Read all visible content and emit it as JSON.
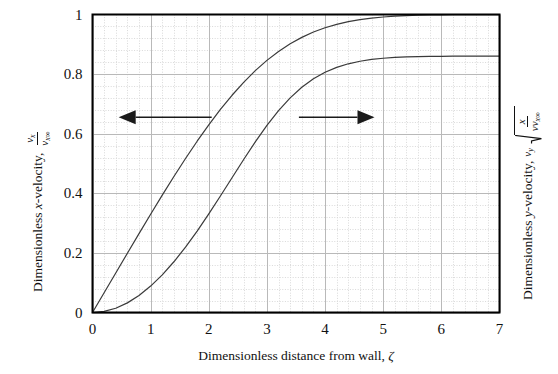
{
  "figure": {
    "background_color": "#ffffff",
    "frame_color": "#000000",
    "curve_color": "#3a3a3a",
    "major_grid_color": "#b9b9b9",
    "minor_grid_color": "#d9d9d9",
    "arrow_color": "#1a1a1a"
  },
  "axes": {
    "left": {
      "title_prefix": "Dimensionless",
      "title_var": "x",
      "title_suffix": "-velocity,",
      "symbol_numerator": "v",
      "symbol_numerator_sub": "x",
      "symbol_denominator": "v",
      "symbol_denominator_sub": "x∞",
      "ticks": [
        "0",
        "0.2",
        "0.4",
        "0.6",
        "0.8",
        "1"
      ],
      "tick_values": [
        0,
        0.2,
        0.4,
        0.6,
        0.8,
        1
      ],
      "range": [
        0,
        1
      ],
      "minor_per_major": 5
    },
    "right": {
      "title_prefix": "Dimensionless",
      "title_var": "y",
      "title_suffix": "-velocity,",
      "symbol_main": "v",
      "symbol_main_sub": "y",
      "radical_numerator": "x",
      "radical_denominator": "νv",
      "radical_denominator_sub": "x∞"
    },
    "bottom": {
      "title": "Dimensionless distance from wall,",
      "title_symbol": "ζ",
      "ticks": [
        "0",
        "1",
        "2",
        "3",
        "4",
        "5",
        "6",
        "7"
      ],
      "tick_values": [
        0,
        1,
        2,
        3,
        4,
        5,
        6,
        7
      ],
      "range": [
        0,
        7
      ],
      "minor_per_major": 5
    }
  },
  "annotations": [
    {
      "name": "left-pointing-arrow",
      "direction": "left",
      "at_y": 0.655,
      "x_start": 2.05,
      "x_end": 0.45
    },
    {
      "name": "right-pointing-arrow",
      "direction": "right",
      "at_y": 0.655,
      "x_start": 3.55,
      "x_end": 4.85
    }
  ],
  "chart_data": {
    "type": "line",
    "title": "",
    "xlabel": "Dimensionless distance from wall, ζ",
    "ylabel_left": "Dimensionless x-velocity, v_x / v_x∞",
    "ylabel_right": "Dimensionless y-velocity, v_y √(x / (ν v_x∞))",
    "xlim": [
      0,
      7
    ],
    "ylim": [
      0,
      1
    ],
    "grid": true,
    "grid_minor": true,
    "legend": "none",
    "x": [
      0,
      0.2,
      0.4,
      0.6,
      0.8,
      1.0,
      1.2,
      1.4,
      1.6,
      1.8,
      2.0,
      2.2,
      2.4,
      2.6,
      2.8,
      3.0,
      3.2,
      3.4,
      3.6,
      3.8,
      4.0,
      4.2,
      4.4,
      4.6,
      4.8,
      5.0,
      5.2,
      5.4,
      5.6,
      5.8,
      6.0,
      6.2,
      6.4,
      6.6,
      6.8,
      7.0
    ],
    "series": [
      {
        "name": "x-velocity (f')",
        "axis": "left",
        "asymptote": 1.0,
        "values": [
          0.0,
          0.0664,
          0.1328,
          0.1989,
          0.2647,
          0.3298,
          0.3938,
          0.4563,
          0.5168,
          0.5748,
          0.6298,
          0.6813,
          0.729,
          0.7725,
          0.8115,
          0.8461,
          0.8761,
          0.9018,
          0.9233,
          0.9411,
          0.9555,
          0.967,
          0.9759,
          0.9827,
          0.9878,
          0.9916,
          0.9943,
          0.9962,
          0.9975,
          0.9984,
          0.999,
          0.9994,
          0.9996,
          0.9998,
          0.9999,
          0.9999
        ]
      },
      {
        "name": "y-velocity (ζf'−f)/2 scaled",
        "axis": "right",
        "asymptote": 0.8604,
        "values": [
          0.0,
          0.0066,
          0.0266,
          0.0597,
          0.1056,
          0.1638,
          0.2338,
          0.3147,
          0.4055,
          0.5049,
          0.6112,
          0.7225,
          0.8361,
          0.9492,
          1.0584,
          1.1605,
          1.2523,
          1.3315,
          1.397,
          1.4495,
          1.49,
          1.5205,
          1.5427,
          1.5586,
          1.5696,
          1.577,
          1.582,
          1.5852,
          1.5872,
          1.5885,
          1.5893,
          1.5897,
          1.59,
          1.5902,
          1.5903,
          1.5904
        ],
        "note": "plotted as value/1.8485 so plateau reads 0.8604 on the 0-1 left scale"
      }
    ]
  }
}
